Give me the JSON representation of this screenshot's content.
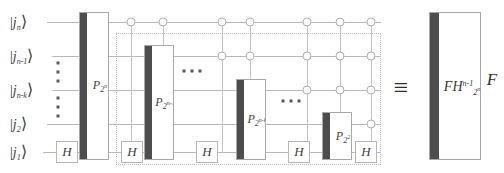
{
  "figure": {
    "kind": "quantum-circuit-identity",
    "equivalence_symbol": "≡"
  },
  "qubits": [
    {
      "id": "q_n",
      "label_base": "j",
      "label_sub": "n",
      "y": 22
    },
    {
      "id": "q_n1",
      "label_base": "j",
      "label_sub": "n-1",
      "y": 56
    },
    {
      "id": "q_nk",
      "label_base": "j",
      "label_sub": "n-k",
      "y": 90
    },
    {
      "id": "q_2",
      "label_base": "j",
      "label_sub": "2",
      "y": 124
    },
    {
      "id": "q_1",
      "label_base": "j",
      "label_sub": "1",
      "y": 152
    }
  ],
  "hadamard": {
    "label": "H",
    "gates": [
      {
        "x": 66,
        "y": 152
      },
      {
        "x": 124,
        "y": 152
      },
      {
        "x": 207,
        "y": 152
      },
      {
        "x": 299,
        "y": 152
      },
      {
        "x": 357,
        "y": 152
      }
    ]
  },
  "phase_gates": [
    {
      "name": "P-2-n",
      "base": "P",
      "sub_base": "2",
      "sub_sup": "n",
      "x": 79,
      "y": 12,
      "w": 30,
      "h": 148
    },
    {
      "name": "P-2-n-1",
      "base": "P",
      "sub_base": "2",
      "sub_sup": "n-1",
      "x": 144,
      "y": 45,
      "w": 30,
      "h": 115
    },
    {
      "name": "P-2-n-k",
      "base": "P",
      "sub_base": "2",
      "sub_sup": "n-k",
      "x": 236,
      "y": 79,
      "w": 30,
      "h": 81
    },
    {
      "name": "P-2-2",
      "base": "P",
      "sub_base": "2",
      "sub_sup": "2",
      "x": 322,
      "y": 112,
      "w": 30,
      "h": 48
    }
  ],
  "controls": [
    {
      "x": 131,
      "y": 22
    },
    {
      "x": 163,
      "y": 22
    },
    {
      "x": 222,
      "y": 22
    },
    {
      "x": 250,
      "y": 22
    },
    {
      "x": 307,
      "y": 22
    },
    {
      "x": 340,
      "y": 22
    },
    {
      "x": 371,
      "y": 22
    },
    {
      "x": 222,
      "y": 56
    },
    {
      "x": 250,
      "y": 56
    },
    {
      "x": 307,
      "y": 56
    },
    {
      "x": 340,
      "y": 56
    },
    {
      "x": 371,
      "y": 56
    },
    {
      "x": 307,
      "y": 90
    },
    {
      "x": 340,
      "y": 90
    },
    {
      "x": 371,
      "y": 90
    },
    {
      "x": 371,
      "y": 124
    }
  ],
  "dotted_box": {
    "x": 116,
    "y": 33,
    "w": 265,
    "h": 132
  },
  "ellipses": {
    "horizontal": [
      {
        "x": 192,
        "y": 71
      },
      {
        "x": 291,
        "y": 101
      }
    ],
    "vertical": [
      {
        "x": 58,
        "y": 72
      },
      {
        "x": 58,
        "y": 107
      }
    ]
  },
  "rhs": {
    "box": {
      "x": 429,
      "y": 12,
      "w": 52,
      "h": 148
    },
    "label_base": "FH",
    "label_sup": "n-1",
    "label_sub_base": "2",
    "label_sub_sup": "n",
    "outer_label": "F"
  }
}
